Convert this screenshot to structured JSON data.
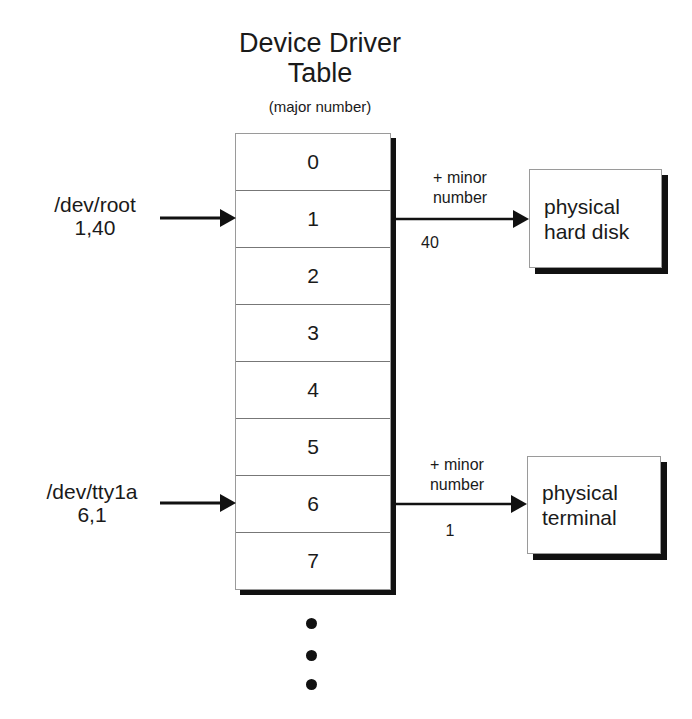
{
  "title": {
    "line1": "Device Driver",
    "line2": "Table"
  },
  "subtitle": "(major number)",
  "table_rows": [
    "0",
    "1",
    "2",
    "3",
    "4",
    "5",
    "6",
    "7"
  ],
  "devices": [
    {
      "name": "/dev/root",
      "numbers": "1,40",
      "target_row": "1",
      "arrow_label_top": "+ minor",
      "arrow_label_mid": "number",
      "minor": "40",
      "target_line1": "physical",
      "target_line2": "hard disk"
    },
    {
      "name": "/dev/tty1a",
      "numbers": "6,1",
      "target_row": "6",
      "arrow_label_top": "+ minor",
      "arrow_label_mid": "number",
      "minor": "1",
      "target_line1": "physical",
      "target_line2": "terminal"
    }
  ],
  "continuation": "ellipsis-dots"
}
